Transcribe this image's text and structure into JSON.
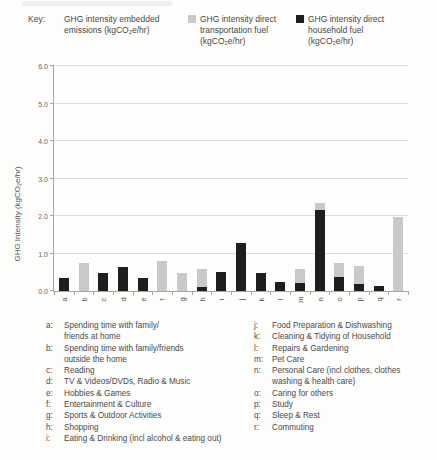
{
  "page": {
    "top_fragment": "cut-off caption fragment"
  },
  "key": {
    "label": "Key:",
    "entries": [
      {
        "name": "embedded-emissions",
        "swatch": null,
        "lines": [
          "GHG intensity embedded",
          "emissions (kgCO₂e/hr)"
        ]
      },
      {
        "name": "direct-transportation-fuel",
        "swatch": "#c9c9c8",
        "lines": [
          "GHG intensity direct",
          "transportation fuel",
          "(kgCO₂e/hr)"
        ]
      },
      {
        "name": "direct-household-fuel",
        "swatch": "#1e1e1e",
        "lines": [
          "GHG intensity direct",
          "household fuel",
          "(kgCO₂e/hr)"
        ]
      }
    ]
  },
  "chart_data": {
    "type": "bar",
    "stacked": true,
    "title": "",
    "ylabel": "GHG Intensity (kgCO₂e/hr)",
    "xlabel": "",
    "ylim": [
      0,
      6
    ],
    "ytick_step": 1,
    "ytick_labels": [
      "0.0",
      "1.0",
      "2.0",
      "3.0",
      "4.0",
      "5.0",
      "6.0"
    ],
    "grid": true,
    "legend_position": "top",
    "categories": [
      "a",
      "b",
      "c",
      "d",
      "e",
      "f",
      "g",
      "h",
      "i",
      "j",
      "k",
      "l",
      "m",
      "n",
      "o",
      "p",
      "q",
      "r"
    ],
    "series": [
      {
        "name": "GHG intensity direct household fuel (kgCO₂e/hr)",
        "color": "#1e1e1e",
        "values": [
          0.34,
          0,
          0.47,
          0.64,
          0.35,
          0,
          0,
          0.1,
          0.51,
          1.29,
          0.48,
          0.24,
          0.22,
          2.16,
          0.38,
          0.19,
          0.13,
          0
        ]
      },
      {
        "name": "GHG intensity direct transportation fuel (kgCO₂e/hr)",
        "color": "#c9c9c8",
        "values": [
          0,
          0.75,
          0,
          0,
          0,
          0.79,
          0.47,
          0.49,
          0,
          0,
          0,
          0,
          0.36,
          0.18,
          0.36,
          0.48,
          0,
          1.97
        ]
      }
    ]
  },
  "activity_legend": {
    "left": [
      {
        "letter": "a:",
        "lines": [
          "Spending time with family/",
          "friends at home"
        ]
      },
      {
        "letter": "b:",
        "lines": [
          "Spending time with family/friends",
          "outside the home"
        ]
      },
      {
        "letter": "c:",
        "lines": [
          "Reading"
        ]
      },
      {
        "letter": "d:",
        "lines": [
          "TV & Videos/DVDs, Radio & Music"
        ]
      },
      {
        "letter": "e:",
        "lines": [
          "Hobbies & Games"
        ]
      },
      {
        "letter": "f:",
        "lines": [
          "Entertainment & Culture"
        ]
      },
      {
        "letter": "g:",
        "lines": [
          "Sports & Outdoor Activities"
        ]
      },
      {
        "letter": "h:",
        "lines": [
          "Shopping"
        ]
      },
      {
        "letter": "i:",
        "lines": [
          "Eating & Drinking (incl alcohol & eating out)"
        ]
      }
    ],
    "right": [
      {
        "letter": "j:",
        "lines": [
          "Food Preparation & Dishwashing"
        ]
      },
      {
        "letter": "k:",
        "lines": [
          "Cleaning & Tidying of Household"
        ]
      },
      {
        "letter": "l:",
        "lines": [
          "Repairs & Gardening"
        ]
      },
      {
        "letter": "m:",
        "lines": [
          "Pet Care"
        ]
      },
      {
        "letter": "n:",
        "lines": [
          "Personal Care (incl clothes, clothes",
          "washing & health care)"
        ]
      },
      {
        "letter": "o:",
        "lines": [
          "Caring for others"
        ]
      },
      {
        "letter": "p:",
        "lines": [
          "Study"
        ]
      },
      {
        "letter": "q:",
        "lines": [
          "Sleep & Rest"
        ]
      },
      {
        "letter": "r:",
        "lines": [
          "Commuting"
        ]
      }
    ]
  }
}
